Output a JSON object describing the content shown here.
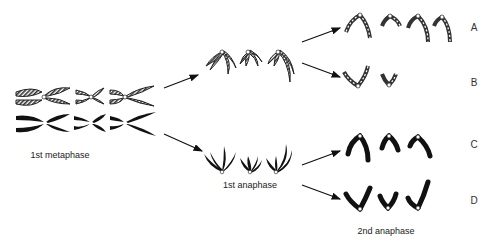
{
  "figure": {
    "stage_labels": {
      "first_metaphase": "1st metaphase",
      "first_anaphase": "1st anaphase",
      "second_anaphase": "2nd anaphase"
    },
    "outcome_labels": [
      "A",
      "B",
      "C",
      "D"
    ],
    "colors": {
      "solid_chromosome": "#111111",
      "striped_chromosome": "#444444",
      "centromere": "#ffffff",
      "arrow": "#111111"
    }
  }
}
